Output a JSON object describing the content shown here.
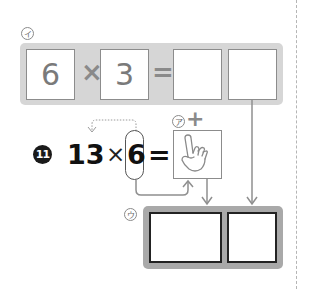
{
  "top_equation": {
    "label": "イ",
    "operand_1": "6",
    "operator": "×",
    "operand_2": "3",
    "equals": "=",
    "answer_tens": "",
    "answer_ones": ""
  },
  "problem": {
    "number": "11",
    "multiplicand": "13",
    "operator": "×",
    "multiplier": "6",
    "equals": "="
  },
  "hint_box": {
    "label": "ア",
    "plus_sign": "+",
    "icon": "pointing-hand-icon"
  },
  "bottom_answer": {
    "label": "ウ",
    "answer_tens": "",
    "answer_ones": ""
  },
  "colors": {
    "top_panel": "#d6d6d6",
    "bottom_panel": "#a9a9a9",
    "arrow_gray": "#8f8f8f",
    "text_dark": "#111111"
  }
}
